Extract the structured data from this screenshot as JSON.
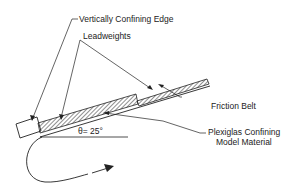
{
  "labels": {
    "vertical_edge": "Vertically Confining Edge",
    "leadweights": "Leadweights",
    "friction_belt": "Friction Belt",
    "plexiglas_line1": "Plexiglas Confining",
    "plexiglas_line2": "Model Material",
    "angle": "θ= 25°"
  },
  "colors": {
    "ink": "#222222",
    "background": "#ffffff"
  }
}
